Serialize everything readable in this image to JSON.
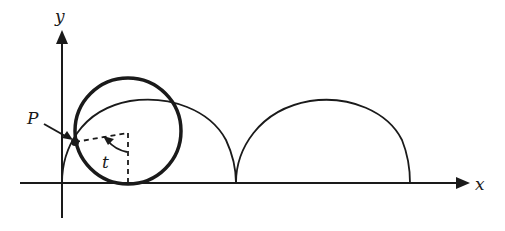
{
  "figure": {
    "type": "cycloid-diagram",
    "axes": {
      "x_label": "x",
      "y_label": "y"
    },
    "labels": {
      "point": "P",
      "angle": "t"
    },
    "colors": {
      "ink": "#1a1a1a",
      "background": "#ffffff"
    },
    "geometry": {
      "origin": [
        62,
        183
      ],
      "rolling_circle": {
        "center": [
          128,
          131
        ],
        "radius": 53
      },
      "arches": [
        {
          "start_x": 62,
          "end_x": 236,
          "peak_y": 100
        },
        {
          "start_x": 236,
          "end_x": 410,
          "peak_y": 100
        }
      ],
      "point_P": [
        75,
        142
      ],
      "dashed_corner": [
        128,
        133
      ]
    }
  }
}
